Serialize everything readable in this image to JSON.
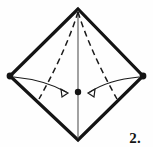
{
  "figure": {
    "kind": "origami-fold-diagram",
    "step_label": "2.",
    "background_color": "#fefefe",
    "outline_color": "#141414",
    "crease_color": "#1a1a1a",
    "arrow_color": "#1a1a1a",
    "center_line_color": "#555555",
    "outline_width": 3.2,
    "crease_width": 1.4,
    "arrow_width": 1.2,
    "center_line_width": 1.1
  },
  "geometry": {
    "vertices": {
      "top": {
        "label": "apex",
        "x": 78,
        "y": 9
      },
      "left": {
        "label": "left-corner",
        "x": 10,
        "y": 76
      },
      "right": {
        "label": "right-corner",
        "x": 143,
        "y": 76
      },
      "bottom": {
        "label": "bottom-corner",
        "x": 78,
        "y": 140
      }
    },
    "center_point": {
      "label": "center-dot",
      "x": 78,
      "y": 92,
      "radius": 3.2
    },
    "vertex_dot_radius": 3.4,
    "outline_path": "M 78 9 L 10 76 L 78 140 L 143 76 Z",
    "center_line_path": "M 78 11 L 78 138",
    "crease_left_path": "M 78 12 C 68 44, 52 76, 39 99",
    "crease_right_path": "M 78 12 C 88 44, 104 76, 117 99",
    "arrow_left_path": "M 14 77 C 34 79, 52 84, 66 92",
    "arrow_right_path": "M 139 77 C 119 79, 102 84, 90 92",
    "arrow_left_head": {
      "x": 68,
      "y": 93,
      "angle": 32
    },
    "arrow_right_head": {
      "x": 88,
      "y": 93,
      "angle": 148
    },
    "arrow_head_size": 7
  },
  "elements": {
    "outline_name": "diamond-outline",
    "center_line_name": "vertical-center-line",
    "crease_left_name": "dashed-crease-left",
    "crease_right_name": "dashed-crease-right",
    "arrow_left_name": "fold-arrow-left",
    "arrow_right_name": "fold-arrow-right",
    "dot_left_name": "corner-dot-left",
    "dot_right_name": "corner-dot-right",
    "dot_top_name": "corner-dot-top",
    "dot_bottom_name": "corner-dot-bottom",
    "dot_center_name": "center-dot"
  }
}
